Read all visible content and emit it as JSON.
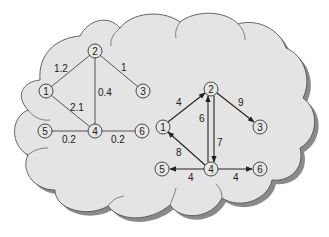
{
  "figure": {
    "background_color": "#ffffff",
    "cloud_fill": "#e4e4e4",
    "cloud_stroke": "#555555",
    "shadow_color": "#8a8a8a"
  },
  "undirected_graph": {
    "nodes": [
      {
        "id": "1",
        "label": "1",
        "x": 46,
        "y": 91
      },
      {
        "id": "2",
        "label": "2",
        "x": 95,
        "y": 51
      },
      {
        "id": "3",
        "label": "3",
        "x": 143,
        "y": 91
      },
      {
        "id": "4",
        "label": "4",
        "x": 95,
        "y": 131
      },
      {
        "id": "5",
        "label": "5",
        "x": 45,
        "y": 131
      },
      {
        "id": "6",
        "label": "6",
        "x": 142,
        "y": 131
      }
    ],
    "edges": [
      {
        "from": "1",
        "to": "2",
        "weight": "1.2"
      },
      {
        "from": "2",
        "to": "3",
        "weight": "1"
      },
      {
        "from": "2",
        "to": "4",
        "weight": "0.4"
      },
      {
        "from": "1",
        "to": "4",
        "weight": "2.1"
      },
      {
        "from": "5",
        "to": "4",
        "weight": "0.2"
      },
      {
        "from": "4",
        "to": "6",
        "weight": "0.2"
      }
    ]
  },
  "directed_graph": {
    "nodes": [
      {
        "id": "1",
        "label": "1",
        "x": 163,
        "y": 127
      },
      {
        "id": "2",
        "label": "2",
        "x": 211,
        "y": 89
      },
      {
        "id": "3",
        "label": "3",
        "x": 260,
        "y": 127
      },
      {
        "id": "4",
        "label": "4",
        "x": 211,
        "y": 169
      },
      {
        "id": "5",
        "label": "5",
        "x": 162,
        "y": 169
      },
      {
        "id": "6",
        "label": "6",
        "x": 260,
        "y": 169
      }
    ],
    "edges": [
      {
        "from": "1",
        "to": "2",
        "weight": "4"
      },
      {
        "from": "2",
        "to": "3",
        "weight": "9"
      },
      {
        "from": "4",
        "to": "2",
        "weight": "6"
      },
      {
        "from": "2",
        "to": "4",
        "weight": "7"
      },
      {
        "from": "4",
        "to": "1",
        "weight": "8"
      },
      {
        "from": "4",
        "to": "5",
        "weight": "4"
      },
      {
        "from": "4",
        "to": "6",
        "weight": "4"
      }
    ]
  }
}
